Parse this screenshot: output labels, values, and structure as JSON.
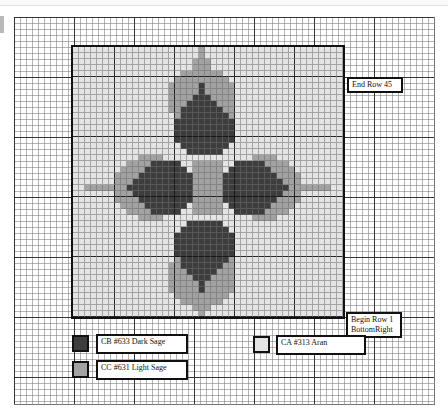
{
  "colors": {
    "CA": "#e4e4e4",
    "CB": "#3d3d3d",
    "CC": "#a2a2a2"
  },
  "labels": {
    "end_row": "End Row 45",
    "begin_row_line1": "Begin Row 1",
    "begin_row_line2": "BottomRight"
  },
  "legend": [
    {
      "code": "CB",
      "text": "CB #633 Dark Sage",
      "color": "#3d3d3d"
    },
    {
      "code": "CC",
      "text": "CC #631 Light Sage",
      "color": "#a2a2a2"
    },
    {
      "code": "CA",
      "text": "CA #313 Aran",
      "color": "#e4e4e4"
    }
  ],
  "chart_data": {
    "type": "table",
    "rows": 45,
    "cols": 45,
    "key": {
      "A": "CA #313 Aran",
      "B": "CB #633 Dark Sage",
      "C": "CC #631 Light Sage"
    },
    "grid": [
      "AAAAAAAAAAAAAAAAAAAAACAAAAAAAAAAAAAAAAAAAAAAA",
      "AAAAAAAAAAAAAAAAAAAAACAAAAAAAAAAAAAAAAAAAAAAA",
      "AAAAAAAAAAAAAAAAAAAACCCAAAAAAAAAAAAAAAAAAAAAA",
      "AAAAAAAAAAAAAAAAAAAACCCAAAAAAAAAAAAAAAAAAAAAA",
      "AAAAAAAAAAAAAAAAAACCCCCCCAAAAAAAAAAAAAAAAAAAA",
      "AAAAAAAAAAAAAAAAACCCCCCCCCAAAAAAAAAAAAAAAAAAA",
      "AAAAAAAAAAAAAAAACCCCCBCCCCCAAAAAAAAAAAAAAAAAA",
      "AAAAAAAAAAAAAAAACCCCCBCCCCCAAAAAAAAAAAAAAAAAA",
      "AAAAAAAAAAAAAAAACCCCBBBCCCCAAAAAAAAAAAAAAAAAA",
      "AAAAAAAAAAAAAAAACCCBBBBBCCCAAAAAAAAAAAAAAAAAA",
      "AAAAAAAAAAAAAAAACCBBBBBBBCCAAAAAAAAAAAAAAAAAA",
      "AAAAAAAAAAAAAAAAACBBBBBBBBCAAAAAAAAAAAAAAAAAA",
      "AAAAAAAAAAAAAAAAABBBBBBBBBBAAAAAAAAAAAAAAAAAA",
      "AAAAAAAAAAAAAAAAABBBBBBBBBBAAAAAAAAAAAAAAAAAA",
      "AAAAAAAAAAAAAAAAABBBBBBBBBBAAAAAAAAAAAAAAAAAA",
      "AAAAAAAAAAAAAAAAABBBBBBBBBBAAAAAAAAAAAAAAAAAA",
      "AAAAAAAAAAAAAAAAAABBBBBBBBAAAAAAAAAAAAAAAAAAA",
      "AAAAAAAAAAAAAAAAAAABBBBBBAAAAAAAAAAAAAAAAAAAA",
      "AAAAAAAAAAACCCCAAAAAAAAAAAAAAACCCCAAAAAAAAAAA",
      "AAAAAAAAACCCCBBBBBAACCCCCAABBBBBCCCCAAAAAAAAA",
      "AAAAAAAACCCCBBBBBBBACCCCCABBBBBBBCCCCAAAAAAAA",
      "AAAAAAACCCCBBBBBBBBBCCCCCBBBBBBBBBCCCCAAAAAAA",
      "AAAAAAACCCBBBBBBBBBBCCCCCBBBBBBBBBBCCCAAAAAAA",
      "AACCCCCCCBBBBBBBBBBBCCCCCBBBBBBBBBBBCCCCCCCAA",
      "AAAAAAACCCBBBBBBBBBBCCCCCBBBBBBBBBBCCCAAAAAAA",
      "AAAAAAACCCCBBBBBBBBBCCCCCBBBBBBBBBCCCCAAAAAAA",
      "AAAAAAAACCCCBBBBBBBACCCCCABBBBBBBCCCCAAAAAAAA",
      "AAAAAAAAACCCCBBBBBAACCCCCAABBBBBCCCCAAAAAAAAA",
      "AAAAAAAAAAACCCCAAAAAAAAAAAAAAACCCCAAAAAAAAAAA",
      "AAAAAAAAAAAAAAAAAAABBBBBBAAAAAAAAAAAAAAAAAAAA",
      "AAAAAAAAAAAAAAAAAABBBBBBBBAAAAAAAAAAAAAAAAAAA",
      "AAAAAAAAAAAAAAAAABBBBBBBBBBAAAAAAAAAAAAAAAAAA",
      "AAAAAAAAAAAAAAAAABBBBBBBBBBAAAAAAAAAAAAAAAAAA",
      "AAAAAAAAAAAAAAAAABBBBBBBBBBAAAAAAAAAAAAAAAAAA",
      "AAAAAAAAAAAAAAAAABBBBBBBBBBAAAAAAAAAAAAAAAAAA",
      "AAAAAAAAAAAAAAAAACBBBBBBBBCAAAAAAAAAAAAAAAAAA",
      "AAAAAAAAAAAAAAAACCBBBBBBBCCAAAAAAAAAAAAAAAAAA",
      "AAAAAAAAAAAAAAAACCCBBBBBCCCAAAAAAAAAAAAAAAAAA",
      "AAAAAAAAAAAAAAAACCCCBBBCCCCAAAAAAAAAAAAAAAAAA",
      "AAAAAAAAAAAAAAAACCCCCBCCCCCAAAAAAAAAAAAAAAAAA",
      "AAAAAAAAAAAAAAAACCCCCBCCCCCAAAAAAAAAAAAAAAAAA",
      "AAAAAAAAAAAAAAAAACCCCCCCCCAAAAAAAAAAAAAAAAAAA",
      "AAAAAAAAAAAAAAAAAACCCCCCCAAAAAAAAAAAAAAAAAAAA",
      "AAAAAAAAAAAAAAAAAAAACCCAAAAAAAAAAAAAAAAAAAAAA",
      "AAAAAAAAAAAAAAAAAAAAACAAAAAAAAAAAAAAAAAAAAAAA"
    ]
  }
}
